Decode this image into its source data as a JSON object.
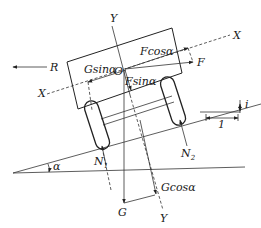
{
  "diagram": {
    "type": "free-body diagram",
    "labels": {
      "R": "R",
      "G_sin": "Gsinα",
      "F_cos": "Fcosα",
      "F_sin": "Fsinα",
      "F": "F",
      "O": "O",
      "X_top": "X",
      "X_left": "X",
      "Y_top": "Y",
      "Y_bottom": "Y",
      "N1": "N",
      "N1_sub": "1",
      "N2": "N",
      "N2_sub": "2",
      "G": "G",
      "G_cos": "Gcosα",
      "alpha": "α",
      "slope_run": "1",
      "slope_rise": "i"
    },
    "forces": [
      {
        "name": "R",
        "direction": "left, horizontal"
      },
      {
        "name": "F",
        "direction": "right, slightly downward"
      },
      {
        "name": "Fcosα",
        "direction": "along X axis"
      },
      {
        "name": "Fsinα",
        "direction": "along Y axis downward"
      },
      {
        "name": "Gsinα",
        "direction": "along -X axis"
      },
      {
        "name": "G",
        "direction": "vertical down"
      },
      {
        "name": "Gcosα",
        "direction": "along Y axis downward"
      },
      {
        "name": "N1",
        "direction": "normal to slope at rear wheel"
      },
      {
        "name": "N2",
        "direction": "normal to slope at front wheel"
      }
    ],
    "axes": [
      "X (along slope)",
      "Y (perpendicular to slope)"
    ],
    "origin": "O",
    "angle": "α"
  }
}
